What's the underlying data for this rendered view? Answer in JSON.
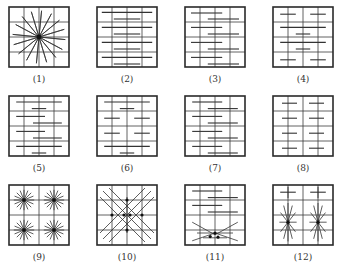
{
  "grid": {
    "cols": 4,
    "rows": 4,
    "size": 60,
    "border_color": "#2a2a2a",
    "line_color": "#3a3a3a",
    "stroke_color": "#333333"
  },
  "panels": [
    {
      "label": "(1)",
      "x": 9,
      "y": 7,
      "pattern": "radial",
      "center": [
        0.5,
        0.5
      ],
      "rays": 16,
      "radius": 0.44
    },
    {
      "label": "(2)",
      "x": 97,
      "y": 7,
      "pattern": "hlines",
      "segments": [
        [
          0.08,
          0.92,
          0.09
        ],
        [
          0.28,
          0.72,
          0.2
        ],
        [
          0.08,
          0.92,
          0.34
        ],
        [
          0.28,
          0.72,
          0.45
        ],
        [
          0.08,
          0.92,
          0.59
        ],
        [
          0.28,
          0.72,
          0.7
        ],
        [
          0.08,
          0.92,
          0.84
        ],
        [
          0.28,
          0.72,
          0.95
        ]
      ]
    },
    {
      "label": "(3)",
      "x": 185,
      "y": 7,
      "pattern": "hlines",
      "segments": [
        [
          0.1,
          0.62,
          0.1
        ],
        [
          0.38,
          0.9,
          0.2
        ],
        [
          0.1,
          0.62,
          0.34
        ],
        [
          0.38,
          0.9,
          0.45
        ],
        [
          0.1,
          0.62,
          0.59
        ],
        [
          0.38,
          0.9,
          0.7
        ],
        [
          0.1,
          0.62,
          0.84
        ],
        [
          0.38,
          0.9,
          0.95
        ]
      ]
    },
    {
      "label": "(4)",
      "x": 273,
      "y": 7,
      "pattern": "hlines",
      "segments": [
        [
          0.12,
          0.38,
          0.12
        ],
        [
          0.62,
          0.88,
          0.12
        ],
        [
          0.12,
          0.88,
          0.34
        ],
        [
          0.38,
          0.62,
          0.45
        ],
        [
          0.12,
          0.88,
          0.59
        ],
        [
          0.38,
          0.62,
          0.7
        ],
        [
          0.12,
          0.38,
          0.88
        ],
        [
          0.62,
          0.88,
          0.88
        ]
      ]
    },
    {
      "label": "(5)",
      "x": 9,
      "y": 96,
      "pattern": "hlines",
      "segments": [
        [
          0.12,
          0.88,
          0.1
        ],
        [
          0.38,
          0.62,
          0.21
        ],
        [
          0.12,
          0.6,
          0.34
        ],
        [
          0.4,
          0.88,
          0.45
        ],
        [
          0.12,
          0.6,
          0.59
        ],
        [
          0.4,
          0.88,
          0.7
        ],
        [
          0.12,
          0.88,
          0.84
        ],
        [
          0.38,
          0.62,
          0.95
        ]
      ]
    },
    {
      "label": "(6)",
      "x": 97,
      "y": 96,
      "pattern": "hlines",
      "segments": [
        [
          0.12,
          0.88,
          0.1
        ],
        [
          0.38,
          0.62,
          0.21
        ],
        [
          0.12,
          0.38,
          0.37
        ],
        [
          0.62,
          0.88,
          0.37
        ],
        [
          0.12,
          0.38,
          0.62
        ],
        [
          0.62,
          0.88,
          0.62
        ],
        [
          0.12,
          0.88,
          0.84
        ],
        [
          0.38,
          0.62,
          0.95
        ]
      ]
    },
    {
      "label": "(7)",
      "x": 185,
      "y": 96,
      "pattern": "hlines",
      "segments": [
        [
          0.12,
          0.62,
          0.1
        ],
        [
          0.38,
          0.88,
          0.21
        ],
        [
          0.12,
          0.62,
          0.34
        ],
        [
          0.38,
          0.88,
          0.45
        ],
        [
          0.12,
          0.62,
          0.59
        ],
        [
          0.38,
          0.88,
          0.7
        ],
        [
          0.12,
          0.62,
          0.84
        ],
        [
          0.38,
          0.88,
          0.95
        ]
      ]
    },
    {
      "label": "(8)",
      "x": 273,
      "y": 96,
      "pattern": "hlines",
      "segments": [
        [
          0.15,
          0.4,
          0.12
        ],
        [
          0.6,
          0.85,
          0.12
        ],
        [
          0.15,
          0.4,
          0.37
        ],
        [
          0.6,
          0.85,
          0.37
        ],
        [
          0.15,
          0.4,
          0.62
        ],
        [
          0.6,
          0.85,
          0.62
        ],
        [
          0.15,
          0.4,
          0.87
        ],
        [
          0.6,
          0.85,
          0.87
        ]
      ]
    },
    {
      "label": "(9)",
      "x": 9,
      "y": 185,
      "pattern": "stars",
      "stars": [
        [
          0.25,
          0.25,
          8,
          0.17
        ],
        [
          0.75,
          0.25,
          8,
          0.17
        ],
        [
          0.25,
          0.75,
          8,
          0.17
        ],
        [
          0.75,
          0.75,
          8,
          0.17
        ]
      ]
    },
    {
      "label": "(10)",
      "x": 97,
      "y": 185,
      "pattern": "diamond",
      "nodes": [
        [
          0.5,
          0.25
        ],
        [
          0.25,
          0.5
        ],
        [
          0.45,
          0.5
        ],
        [
          0.55,
          0.5
        ],
        [
          0.75,
          0.5
        ],
        [
          0.5,
          0.75
        ]
      ],
      "diagonals": [
        [
          0.05,
          0.2,
          0.8,
          0.95
        ],
        [
          0.2,
          0.05,
          0.95,
          0.8
        ],
        [
          0.05,
          0.8,
          0.8,
          0.05
        ],
        [
          0.2,
          0.95,
          0.95,
          0.2
        ],
        [
          0.1,
          0.1,
          0.9,
          0.9
        ],
        [
          0.1,
          0.9,
          0.9,
          0.1
        ]
      ],
      "verticals": [
        [
          0.5,
          0.2,
          0.5,
          0.8
        ]
      ]
    },
    {
      "label": "(11)",
      "x": 185,
      "y": 185,
      "pattern": "mixed",
      "segments": [
        [
          0.12,
          0.62,
          0.1
        ],
        [
          0.38,
          0.88,
          0.21
        ],
        [
          0.12,
          0.62,
          0.34
        ],
        [
          0.38,
          0.88,
          0.45
        ]
      ],
      "cross_rays": [
        [
          0.12,
          0.62,
          0.5,
          0.83
        ],
        [
          0.12,
          0.93,
          0.5,
          0.8
        ],
        [
          0.88,
          0.62,
          0.5,
          0.83
        ],
        [
          0.88,
          0.93,
          0.5,
          0.8
        ],
        [
          0.2,
          0.8,
          0.8,
          0.8
        ],
        [
          0.3,
          0.88,
          0.7,
          0.88
        ]
      ],
      "nodes": [
        [
          0.5,
          0.8
        ],
        [
          0.42,
          0.86
        ],
        [
          0.55,
          0.87
        ]
      ]
    },
    {
      "label": "(12)",
      "x": 273,
      "y": 185,
      "pattern": "mixed12",
      "segments": [
        [
          0.12,
          0.38,
          0.12
        ],
        [
          0.62,
          0.88,
          0.12
        ]
      ],
      "verticals": [
        [
          0.25,
          0.03,
          0.25,
          0.22
        ],
        [
          0.75,
          0.03,
          0.75,
          0.22
        ]
      ],
      "stars": [
        [
          0.25,
          0.62,
          6,
          0.32
        ],
        [
          0.75,
          0.62,
          6,
          0.32
        ]
      ]
    }
  ]
}
